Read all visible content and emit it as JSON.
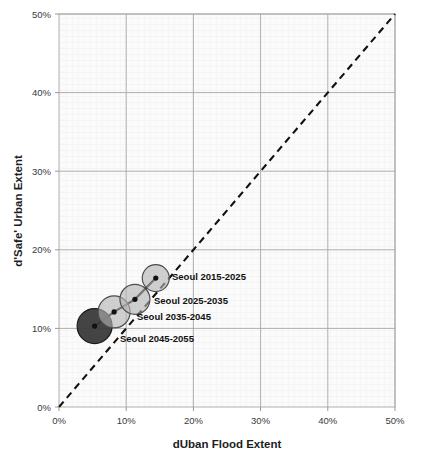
{
  "chart_data": {
    "type": "scatter",
    "title": "",
    "xlabel": "dUban Flood Extent",
    "ylabel": "d'Safe' Urban Extent",
    "xlim": [
      0,
      50
    ],
    "ylim": [
      0,
      50
    ],
    "x_ticks": [
      "0%",
      "10%",
      "20%",
      "30%",
      "40%",
      "50%"
    ],
    "y_ticks": [
      "0%",
      "10%",
      "20%",
      "30%",
      "40%",
      "50%"
    ],
    "x_tick_values": [
      0,
      10,
      20,
      30,
      40,
      50
    ],
    "y_tick_values": [
      0,
      10,
      20,
      30,
      40,
      50
    ],
    "grid": true,
    "legend": "none",
    "reference_line": {
      "name": "1:1 diagonal",
      "style": "dashed",
      "color": "#111111",
      "from": [
        0,
        0
      ],
      "to": [
        50,
        50
      ]
    },
    "connector_line": {
      "style": "solid",
      "color": "#111111"
    },
    "series": [
      {
        "name": "Seoul",
        "points": [
          {
            "label": "Seoul 2015-2025",
            "x": 14.4,
            "y": 16.4,
            "size": 13.5,
            "fill": "#b3b3b3",
            "stroke": "#4d4d4d",
            "label_x": 172,
            "label_y": 280
          },
          {
            "label": "Seoul 2025-2035",
            "x": 11.3,
            "y": 13.7,
            "size": 15.0,
            "fill": "#b3b3b3",
            "stroke": "#4d4d4d",
            "label_x": 154,
            "label_y": 304
          },
          {
            "label": "Seoul 2035-2045",
            "x": 8.2,
            "y": 12.1,
            "size": 16.0,
            "fill": "#b3b3b3",
            "stroke": "#4d4d4d",
            "label_x": 137,
            "label_y": 320
          },
          {
            "label": "Seoul 2045-2055",
            "x": 5.3,
            "y": 10.3,
            "size": 17.5,
            "fill": "#3a3a3a",
            "stroke": "#1a1a1a",
            "label_x": 120,
            "label_y": 342
          }
        ]
      }
    ]
  },
  "colors": {
    "plot_background": "#fafafa",
    "grid": "#a6a6a6",
    "axis": "#999999",
    "text": "#1d1d1d"
  }
}
